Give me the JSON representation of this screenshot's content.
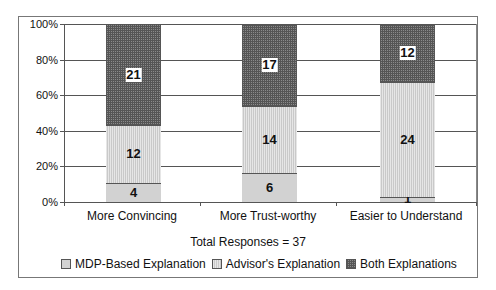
{
  "chart_data": {
    "type": "bar",
    "stacked": true,
    "percent_stacked": true,
    "title": "",
    "subtitle": "Total Responses = 37",
    "xlabel": "",
    "ylabel": "",
    "categories": [
      "More Convincing",
      "More Trust-worthy",
      "Easier to Understand"
    ],
    "series": [
      {
        "name": "MDP-Based Explanation",
        "values": [
          4,
          6,
          1
        ],
        "color": "#d2d2d2"
      },
      {
        "name": "Advisor's Explanation",
        "values": [
          12,
          14,
          24
        ],
        "color": "#dcdcdc"
      },
      {
        "name": "Both Explanations",
        "values": [
          21,
          17,
          12
        ],
        "color": "#6e6e6e"
      }
    ],
    "ylim": [
      0,
      100
    ],
    "yticks": [
      "0%",
      "20%",
      "40%",
      "60%",
      "80%",
      "100%"
    ],
    "grid": true,
    "legend_position": "bottom"
  },
  "axis": {
    "yticks": [
      "0%",
      "20%",
      "40%",
      "60%",
      "80%",
      "100%"
    ]
  },
  "caption": {
    "total": "Total Responses = 37"
  },
  "legend": [
    {
      "label": "MDP-Based Explanation"
    },
    {
      "label": "Advisor's Explanation"
    },
    {
      "label": "Both Explanations"
    }
  ],
  "bars": [
    {
      "category": "More Convincing",
      "mdp": "4",
      "adv": "12",
      "both": "21"
    },
    {
      "category": "More Trust-worthy",
      "mdp": "6",
      "adv": "14",
      "both": "17"
    },
    {
      "category": "Easier to Understand",
      "mdp": "1",
      "adv": "24",
      "both": "12"
    }
  ]
}
